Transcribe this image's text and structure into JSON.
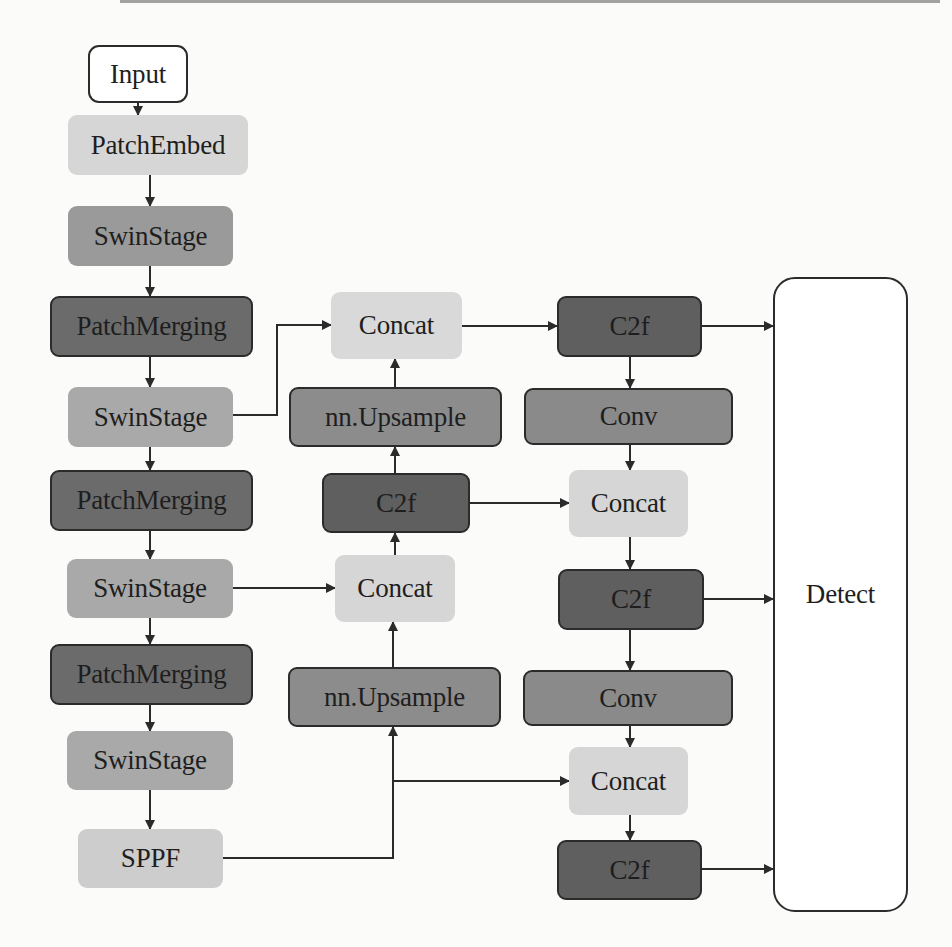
{
  "figure": {
    "colors": {
      "white": "#ffffff",
      "light": "#d3d3d3",
      "lighter": "#dcdcdc",
      "medium": "#a3a3a3",
      "medium_dark": "#8b8b8b",
      "dark": "#6a6a6a",
      "edge": "#2b2b2b",
      "arrow": "#2b2b2b"
    },
    "nodes": [
      {
        "id": "input",
        "label": "Input",
        "x": 88,
        "y": 45,
        "w": 100,
        "h": 58,
        "fill": "#ffffff",
        "outlined": true,
        "radius": 11
      },
      {
        "id": "patchembed",
        "label": "PatchEmbed",
        "x": 68,
        "y": 115,
        "w": 180,
        "h": 60,
        "fill": "#d6d6d6",
        "outlined": false
      },
      {
        "id": "swinstage1",
        "label": "SwinStage",
        "x": 68,
        "y": 206,
        "w": 165,
        "h": 60,
        "fill": "#9a9a9a",
        "outlined": false
      },
      {
        "id": "patchmerging1",
        "label": "PatchMerging",
        "x": 50,
        "y": 296,
        "w": 203,
        "h": 61,
        "fill": "#6b6b6b",
        "outlined": true
      },
      {
        "id": "swinstage2",
        "label": "SwinStage",
        "x": 68,
        "y": 387,
        "w": 165,
        "h": 60,
        "fill": "#a9a9a9",
        "outlined": false
      },
      {
        "id": "patchmerging2",
        "label": "PatchMerging",
        "x": 50,
        "y": 470,
        "w": 203,
        "h": 61,
        "fill": "#6b6b6b",
        "outlined": true
      },
      {
        "id": "swinstage3",
        "label": "SwinStage",
        "x": 67,
        "y": 559,
        "w": 166,
        "h": 59,
        "fill": "#a9a9a9",
        "outlined": false
      },
      {
        "id": "patchmerging3",
        "label": "PatchMerging",
        "x": 50,
        "y": 644,
        "w": 203,
        "h": 61,
        "fill": "#6b6b6b",
        "outlined": true
      },
      {
        "id": "swinstage4",
        "label": "SwinStage",
        "x": 67,
        "y": 731,
        "w": 166,
        "h": 59,
        "fill": "#a9a9a9",
        "outlined": false
      },
      {
        "id": "sppf",
        "label": "SPPF",
        "x": 78,
        "y": 829,
        "w": 145,
        "h": 59,
        "fill": "#cdcdcd",
        "outlined": false
      },
      {
        "id": "concat_mid1",
        "label": "Concat",
        "x": 331,
        "y": 292,
        "w": 131,
        "h": 67,
        "fill": "#d9d9d9",
        "outlined": false
      },
      {
        "id": "upsample1",
        "label": "nn.Upsample",
        "x": 289,
        "y": 387,
        "w": 213,
        "h": 60,
        "fill": "#8c8c8c",
        "outlined": true
      },
      {
        "id": "c2f_mid",
        "label": "C2f",
        "x": 322,
        "y": 473,
        "w": 148,
        "h": 60,
        "fill": "#5f5f5f",
        "outlined": true
      },
      {
        "id": "concat_mid2",
        "label": "Concat",
        "x": 335,
        "y": 555,
        "w": 120,
        "h": 67,
        "fill": "#d6d6d6",
        "outlined": false
      },
      {
        "id": "upsample2",
        "label": "nn.Upsample",
        "x": 288,
        "y": 667,
        "w": 213,
        "h": 60,
        "fill": "#8c8c8c",
        "outlined": true
      },
      {
        "id": "c2f_r1",
        "label": "C2f",
        "x": 557,
        "y": 296,
        "w": 145,
        "h": 61,
        "fill": "#5f5f5f",
        "outlined": true
      },
      {
        "id": "conv_r1",
        "label": "Conv",
        "x": 524,
        "y": 388,
        "w": 209,
        "h": 57,
        "fill": "#8a8a8a",
        "outlined": true
      },
      {
        "id": "concat_r1",
        "label": "Concat",
        "x": 569,
        "y": 470,
        "w": 119,
        "h": 67,
        "fill": "#d6d6d6",
        "outlined": false
      },
      {
        "id": "c2f_r2",
        "label": "C2f",
        "x": 558,
        "y": 569,
        "w": 146,
        "h": 61,
        "fill": "#5f5f5f",
        "outlined": true
      },
      {
        "id": "conv_r2",
        "label": "Conv",
        "x": 523,
        "y": 670,
        "w": 210,
        "h": 56,
        "fill": "#8a8a8a",
        "outlined": true
      },
      {
        "id": "concat_r2",
        "label": "Concat",
        "x": 569,
        "y": 747,
        "w": 119,
        "h": 68,
        "fill": "#d6d6d6",
        "outlined": false
      },
      {
        "id": "c2f_r3",
        "label": "C2f",
        "x": 557,
        "y": 840,
        "w": 145,
        "h": 60,
        "fill": "#5f5f5f",
        "outlined": true
      },
      {
        "id": "detect",
        "label": "Detect",
        "x": 773,
        "y": 277,
        "w": 135,
        "h": 635,
        "fill": "#ffffff",
        "outlined": true,
        "radius": 22
      }
    ],
    "edges": [
      {
        "from": "input",
        "to": "patchembed",
        "points": [
          [
            138,
            103
          ],
          [
            138,
            115
          ]
        ]
      },
      {
        "from": "patchembed",
        "to": "swinstage1",
        "points": [
          [
            150,
            175
          ],
          [
            150,
            206
          ]
        ]
      },
      {
        "from": "swinstage1",
        "to": "patchmerging1",
        "points": [
          [
            150,
            266
          ],
          [
            150,
            296
          ]
        ]
      },
      {
        "from": "patchmerging1",
        "to": "swinstage2",
        "points": [
          [
            150,
            357
          ],
          [
            150,
            387
          ]
        ]
      },
      {
        "from": "swinstage2",
        "to": "patchmerging2",
        "points": [
          [
            150,
            447
          ],
          [
            150,
            470
          ]
        ]
      },
      {
        "from": "patchmerging2",
        "to": "swinstage3",
        "points": [
          [
            150,
            531
          ],
          [
            150,
            559
          ]
        ]
      },
      {
        "from": "swinstage3",
        "to": "patchmerging3",
        "points": [
          [
            150,
            618
          ],
          [
            150,
            644
          ]
        ]
      },
      {
        "from": "patchmerging3",
        "to": "swinstage4",
        "points": [
          [
            150,
            705
          ],
          [
            150,
            731
          ]
        ]
      },
      {
        "from": "swinstage4",
        "to": "sppf",
        "points": [
          [
            150,
            790
          ],
          [
            150,
            829
          ]
        ]
      },
      {
        "from": "swinstage2",
        "to": "concat_mid1",
        "points": [
          [
            233,
            415
          ],
          [
            277,
            415
          ],
          [
            277,
            325
          ],
          [
            331,
            325
          ]
        ]
      },
      {
        "from": "upsample1",
        "to": "concat_mid1",
        "points": [
          [
            395,
            387
          ],
          [
            395,
            359
          ]
        ]
      },
      {
        "from": "c2f_mid",
        "to": "upsample1",
        "points": [
          [
            395,
            473
          ],
          [
            395,
            447
          ]
        ]
      },
      {
        "from": "concat_mid2",
        "to": "c2f_mid",
        "points": [
          [
            395,
            555
          ],
          [
            395,
            533
          ]
        ]
      },
      {
        "from": "swinstage3",
        "to": "concat_mid2",
        "points": [
          [
            233,
            588
          ],
          [
            335,
            588
          ]
        ]
      },
      {
        "from": "upsample2",
        "to": "concat_mid2",
        "points": [
          [
            393,
            667
          ],
          [
            393,
            622
          ]
        ]
      },
      {
        "from": "sppf",
        "to": "upsample2",
        "points": [
          [
            223,
            858
          ],
          [
            393,
            858
          ],
          [
            393,
            727
          ]
        ]
      },
      {
        "from": "sppf",
        "to": "concat_r2",
        "points": [
          [
            393,
            781
          ],
          [
            569,
            781
          ]
        ]
      },
      {
        "from": "concat_mid1",
        "to": "c2f_r1",
        "points": [
          [
            462,
            326
          ],
          [
            557,
            326
          ]
        ]
      },
      {
        "from": "c2f_r1",
        "to": "conv_r1",
        "points": [
          [
            630,
            357
          ],
          [
            630,
            388
          ]
        ]
      },
      {
        "from": "conv_r1",
        "to": "concat_r1",
        "points": [
          [
            630,
            445
          ],
          [
            630,
            470
          ]
        ]
      },
      {
        "from": "c2f_mid",
        "to": "concat_r1",
        "points": [
          [
            470,
            503
          ],
          [
            569,
            503
          ]
        ]
      },
      {
        "from": "concat_r1",
        "to": "c2f_r2",
        "points": [
          [
            630,
            537
          ],
          [
            630,
            569
          ]
        ]
      },
      {
        "from": "c2f_r2",
        "to": "conv_r2",
        "points": [
          [
            630,
            630
          ],
          [
            630,
            670
          ]
        ]
      },
      {
        "from": "conv_r2",
        "to": "concat_r2",
        "points": [
          [
            630,
            726
          ],
          [
            630,
            747
          ]
        ]
      },
      {
        "from": "concat_r2",
        "to": "c2f_r3",
        "points": [
          [
            630,
            815
          ],
          [
            630,
            840
          ]
        ]
      },
      {
        "from": "c2f_r1",
        "to": "detect",
        "points": [
          [
            702,
            326
          ],
          [
            773,
            326
          ]
        ]
      },
      {
        "from": "c2f_r2",
        "to": "detect",
        "points": [
          [
            704,
            599
          ],
          [
            773,
            599
          ]
        ]
      },
      {
        "from": "c2f_r3",
        "to": "detect",
        "points": [
          [
            702,
            869
          ],
          [
            773,
            869
          ]
        ]
      }
    ]
  }
}
